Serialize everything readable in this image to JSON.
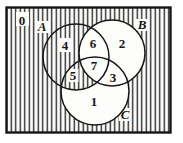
{
  "figure": {
    "type": "venn-diagram",
    "sets": [
      {
        "label": "A"
      },
      {
        "label": "B"
      },
      {
        "label": "C"
      }
    ],
    "regions": [
      {
        "number": "0",
        "membership": "outside all three sets",
        "shaded": true
      },
      {
        "number": "1",
        "membership": "C only",
        "shaded": false
      },
      {
        "number": "2",
        "membership": "B only",
        "shaded": false
      },
      {
        "number": "3",
        "membership": "B and C only",
        "shaded": false
      },
      {
        "number": "4",
        "membership": "A only",
        "shaded": true
      },
      {
        "number": "5",
        "membership": "A and C only",
        "shaded": true
      },
      {
        "number": "6",
        "membership": "A and B only",
        "shaded": false
      },
      {
        "number": "7",
        "membership": "A, B and C",
        "shaded": false
      }
    ],
    "shading": {
      "style": "vertical-hatching",
      "shaded_regions": [
        "0",
        "4",
        "5"
      ],
      "unshaded_regions": [
        "1",
        "2",
        "3",
        "6",
        "7"
      ]
    },
    "colors": {
      "ink": "#191919",
      "paper": "#ffffff"
    }
  }
}
